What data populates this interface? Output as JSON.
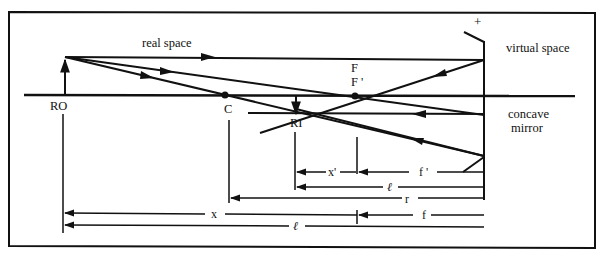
{
  "diagram": {
    "labels": {
      "real_space": "real space",
      "virtual_space": "virtual space",
      "concave_mirror_line1": "concave",
      "concave_mirror_line2": "mirror",
      "plus_sign": "+",
      "real_object": "RO",
      "real_image": "RI",
      "center": "C",
      "focus": "F",
      "focus_prime": "F '"
    },
    "dimensions": {
      "x_prime": "x'",
      "f_prime": "f '",
      "l_image": "ℓ",
      "r": "r",
      "f": "f",
      "x": "x",
      "l_object": "ℓ"
    },
    "colors": {
      "ink": "#111111",
      "background": "#ffffff"
    }
  }
}
